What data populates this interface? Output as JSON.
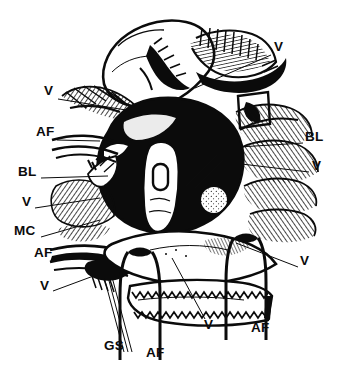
{
  "figure": {
    "name": "anatomical-line-drawing",
    "style": "pen-and-ink hatched anatomical dissection illustration",
    "background_color": "#ffffff",
    "ink_color": "#0b0b0b",
    "width": 339,
    "height": 373
  },
  "labels": [
    {
      "id": "v-top-right",
      "text": "V",
      "x": 274,
      "y": 46,
      "leader": {
        "x1": 271,
        "y1": 55,
        "x2": 195,
        "y2": 88
      }
    },
    {
      "id": "v-upper-left",
      "text": "V",
      "x": 44,
      "y": 90,
      "leader": {
        "x1": 58,
        "y1": 99,
        "x2": 126,
        "y2": 110
      }
    },
    {
      "id": "af-left-upper",
      "text": "AF",
      "x": 36,
      "y": 131,
      "leader": {
        "x1": 57,
        "y1": 140,
        "x2": 100,
        "y2": 141
      }
    },
    {
      "id": "bl-right",
      "text": "BL",
      "x": 305,
      "y": 136,
      "leader": {
        "x1": 303,
        "y1": 143,
        "x2": 223,
        "y2": 148
      }
    },
    {
      "id": "bl-left",
      "text": "BL",
      "x": 18,
      "y": 171,
      "leader": {
        "x1": 41,
        "y1": 178,
        "x2": 108,
        "y2": 176
      }
    },
    {
      "id": "v-right-middle",
      "text": "V",
      "x": 312,
      "y": 165,
      "leader": {
        "x1": 309,
        "y1": 172,
        "x2": 233,
        "y2": 163
      }
    },
    {
      "id": "v-left-middle",
      "text": "V",
      "x": 22,
      "y": 201,
      "leader": {
        "x1": 35,
        "y1": 208,
        "x2": 100,
        "y2": 198
      }
    },
    {
      "id": "mc-left",
      "text": "MC",
      "x": 14,
      "y": 230,
      "leader": {
        "x1": 41,
        "y1": 237,
        "x2": 100,
        "y2": 220
      }
    },
    {
      "id": "af-left-lower",
      "text": "AF",
      "x": 34,
      "y": 252,
      "leader": {
        "x1": 56,
        "y1": 259,
        "x2": 98,
        "y2": 258
      }
    },
    {
      "id": "v-lower-left",
      "text": "V",
      "x": 40,
      "y": 285,
      "leader": {
        "x1": 53,
        "y1": 291,
        "x2": 115,
        "y2": 268
      }
    },
    {
      "id": "v-right-lower",
      "text": "V",
      "x": 300,
      "y": 260,
      "leader": {
        "x1": 298,
        "y1": 267,
        "x2": 236,
        "y2": 243
      }
    },
    {
      "id": "v-bottom",
      "text": "V",
      "x": 204,
      "y": 320,
      "leader": {
        "x1": 205,
        "y1": 319,
        "x2": 172,
        "y2": 258
      }
    },
    {
      "id": "gs-bottom",
      "text": "GS",
      "x": 104,
      "y": 341,
      "leader": null
    },
    {
      "id": "af-bottom",
      "text": "AF",
      "x": 146,
      "y": 348,
      "leader": null
    },
    {
      "id": "af-bottom-right",
      "text": "AF",
      "x": 251,
      "y": 323,
      "leader": null
    }
  ],
  "legend_keys": {
    "V": "vessel",
    "AF": "anterior fascicle / fiber bundle",
    "BL": "basal lamina / layer",
    "MC": "muscular coat",
    "GS": "guide strands"
  }
}
